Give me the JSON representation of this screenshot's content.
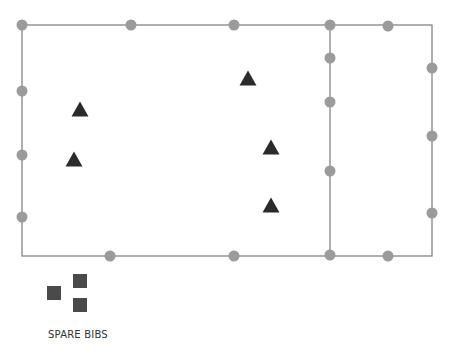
{
  "diagram": {
    "colors": {
      "line": "#7a7a7a",
      "cone": "#9b9b9b",
      "player": "#2b2b2b",
      "bib": "#4a4a4a",
      "text": "#333333"
    },
    "field": {
      "outer": {
        "x1": 22,
        "y1": 25,
        "x2": 432,
        "y2": 256
      },
      "divider_x": 330
    },
    "cones": [
      {
        "x": 22,
        "y": 25
      },
      {
        "x": 131,
        "y": 25
      },
      {
        "x": 234,
        "y": 25
      },
      {
        "x": 330,
        "y": 25
      },
      {
        "x": 388,
        "y": 26
      },
      {
        "x": 330,
        "y": 58
      },
      {
        "x": 330,
        "y": 102
      },
      {
        "x": 330,
        "y": 171
      },
      {
        "x": 432,
        "y": 68
      },
      {
        "x": 432,
        "y": 136
      },
      {
        "x": 432,
        "y": 213
      },
      {
        "x": 22,
        "y": 91
      },
      {
        "x": 22,
        "y": 155
      },
      {
        "x": 22,
        "y": 217
      },
      {
        "x": 110,
        "y": 256
      },
      {
        "x": 234,
        "y": 256
      },
      {
        "x": 330,
        "y": 255
      },
      {
        "x": 388,
        "y": 256
      }
    ],
    "players": [
      {
        "x": 80,
        "y": 110
      },
      {
        "x": 74,
        "y": 160
      },
      {
        "x": 248,
        "y": 79
      },
      {
        "x": 271,
        "y": 148
      },
      {
        "x": 271,
        "y": 206
      }
    ],
    "bibs": [
      {
        "x": 54,
        "y": 293
      },
      {
        "x": 80,
        "y": 281
      },
      {
        "x": 80,
        "y": 305
      }
    ],
    "label": "SPARE BIBS"
  }
}
